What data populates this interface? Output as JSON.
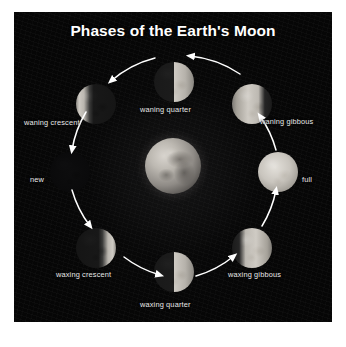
{
  "panel": {
    "title": "Phases of the Earth's Moon",
    "background_color": "#060606",
    "text_color": "#e9e9e9",
    "title_color": "#ffffff"
  },
  "center_body": {
    "name": "earth",
    "label": ""
  },
  "cycle_direction": "counter-clockwise",
  "phases": [
    {
      "id": "waning-quarter",
      "label": "waning quarter",
      "lit": "right-half"
    },
    {
      "id": "waning-crescent",
      "label": "waning crescent",
      "lit": "crescent-left"
    },
    {
      "id": "new",
      "label": "new",
      "lit": "none"
    },
    {
      "id": "waxing-crescent",
      "label": "waxing crescent",
      "lit": "crescent-right"
    },
    {
      "id": "waxing-quarter",
      "label": "waxing quarter",
      "lit": "right-half"
    },
    {
      "id": "waxing-gibbous",
      "label": "waxing gibbous",
      "lit": "gibbous-right"
    },
    {
      "id": "full",
      "label": "full",
      "lit": "full"
    },
    {
      "id": "waning-gibbous",
      "label": "waning gibbous",
      "lit": "gibbous-left"
    }
  ]
}
